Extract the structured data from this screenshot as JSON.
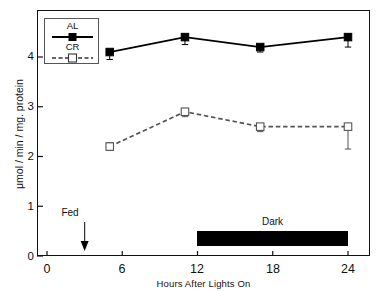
{
  "chart_data": {
    "type": "line",
    "title": "",
    "xlabel": "Hours After Lights On",
    "ylabel": "μmol / min / mg. protein",
    "xlim": [
      0,
      26
    ],
    "ylim": [
      0,
      4.6
    ],
    "xticks": [
      0,
      6,
      12,
      18,
      24
    ],
    "yticks": [
      0,
      1,
      2,
      3,
      4
    ],
    "xtick_labels": [
      "0",
      "6",
      "12",
      "18",
      "24"
    ],
    "ytick_labels": [
      "0",
      "1",
      "2",
      "3",
      "4"
    ],
    "grid": false,
    "legend_position": "upper-left",
    "series": [
      {
        "name": "AL",
        "marker": "filled-square",
        "linestyle": "solid",
        "color": "#000000",
        "x": [
          5,
          11,
          17,
          24
        ],
        "values": [
          4.1,
          4.4,
          4.2,
          4.4
        ],
        "yerr_low": [
          0.15,
          0.15,
          0.1,
          0.2
        ],
        "yerr_high": [
          0.0,
          0.0,
          0.0,
          0.0
        ]
      },
      {
        "name": "CR",
        "marker": "open-square",
        "linestyle": "dashed",
        "color": "#555555",
        "x": [
          5,
          11,
          17,
          24
        ],
        "values": [
          2.2,
          2.9,
          2.6,
          2.6
        ],
        "yerr_low": [
          0.08,
          0.1,
          0.1,
          0.45
        ],
        "yerr_high": [
          0.08,
          0.05,
          0.05,
          0.0
        ]
      }
    ],
    "annotations": [
      {
        "name": "fed-arrow",
        "label": "Fed",
        "x": 3,
        "type": "down-arrow"
      },
      {
        "name": "dark-bar",
        "label": "Dark",
        "x_start": 12,
        "x_end": 24,
        "type": "bar"
      }
    ]
  },
  "legend": {
    "items": [
      {
        "label": "AL"
      },
      {
        "label": "CR"
      }
    ]
  },
  "axes": {
    "x_title": "Hours After Lights On",
    "y_title": "μmol / min / mg. protein"
  },
  "annotations": {
    "fed": "Fed",
    "dark": "Dark"
  },
  "colors": {
    "axis": "#111111",
    "al_series": "#000000",
    "cr_series": "#555555",
    "dark_bar": "#000000"
  }
}
